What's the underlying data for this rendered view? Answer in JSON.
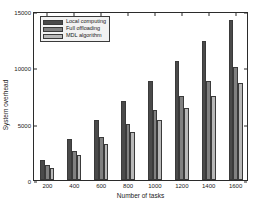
{
  "chart_data": {
    "type": "bar",
    "title": "",
    "xlabel": "Number of tasks",
    "ylabel": "System overhead",
    "categories": [
      "200",
      "400",
      "600",
      "800",
      "1000",
      "1200",
      "1400",
      "1600"
    ],
    "series": [
      {
        "name": "Local computing",
        "color": "#4a4a4a",
        "values": [
          1800,
          3600,
          5300,
          7000,
          8800,
          10550,
          12350,
          14200
        ]
      },
      {
        "name": "Full offloading",
        "color": "#808080",
        "values": [
          1350,
          2600,
          3800,
          4950,
          6250,
          7450,
          8800,
          10050
        ]
      },
      {
        "name": "MDL algorithm",
        "color": "#b8b8b8",
        "values": [
          1100,
          2250,
          3200,
          4250,
          5350,
          6400,
          7500,
          8650
        ]
      }
    ],
    "ylim": [
      0,
      15000
    ],
    "yticks": [
      0,
      5000,
      10000,
      15000
    ],
    "ytick_labels": [
      "0",
      "5000",
      "10000",
      "15000"
    ],
    "xtick_labels": [
      "200",
      "400",
      "600",
      "800",
      "1000",
      "1200",
      "1400",
      "1600"
    ],
    "grid": false,
    "legend_position": "upper left"
  }
}
